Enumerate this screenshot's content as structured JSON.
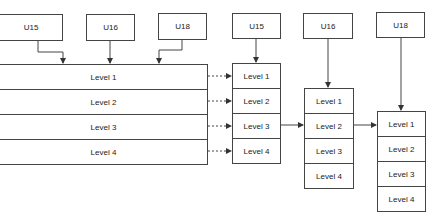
{
  "diagram": {
    "source_boxes_left": [
      {
        "label": "U15"
      },
      {
        "label": "U16"
      },
      {
        "label": "U18"
      }
    ],
    "shared_stack": {
      "levels": [
        "Level 1",
        "Level 2",
        "Level 3",
        "Level 4"
      ]
    },
    "columns": [
      {
        "header": "U15",
        "levels": [
          "Level 1",
          "Level 2",
          "Level 3",
          "Level 4"
        ]
      },
      {
        "header": "U16",
        "levels": [
          "Level 1",
          "Level 2",
          "Level 3",
          "Level 4"
        ]
      },
      {
        "header": "U18",
        "levels": [
          "Level 1",
          "Level 2",
          "Level 3",
          "Level 4"
        ]
      }
    ],
    "colors": {
      "stroke": "#444444",
      "text": "#222222",
      "background": "#ffffff"
    }
  }
}
